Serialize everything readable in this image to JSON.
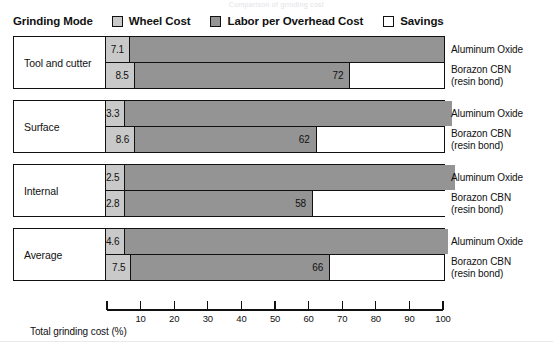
{
  "top_caption": "Comparison of grinding cost",
  "legend": {
    "axis_title": "Grinding Mode",
    "items": [
      {
        "label": "Wheel Cost",
        "icon": "wheel-cost-swatch",
        "color": "#c9c9c9"
      },
      {
        "label": "Labor per Overhead Cost",
        "icon": "labor-overhead-cost-swatch",
        "color": "#949494"
      },
      {
        "label": "Savings",
        "icon": "savings-swatch",
        "color": "#ffffff"
      }
    ]
  },
  "material_labels": {
    "aluminum_oxide": "Aluminum Oxide",
    "borazon_line1": "Borazon CBN",
    "borazon_line2": "(resin bond)"
  },
  "axis": {
    "caption": "Total grinding cost (%)",
    "ticks": [
      0,
      10,
      20,
      30,
      40,
      50,
      60,
      70,
      80,
      90,
      100
    ],
    "tick_labels": [
      "",
      "10",
      "20",
      "30",
      "40",
      "50",
      "60",
      "70",
      "80",
      "90",
      "100"
    ]
  },
  "groups": [
    {
      "mode": "Tool and cutter",
      "rows": [
        {
          "material": "Aluminum Oxide",
          "wheel": 7.1,
          "wheel_label": "7.1",
          "labor": 92.9,
          "labor_label": "",
          "savings": 0,
          "savings_label": ""
        },
        {
          "material": "Borazon CBN (resin bond)",
          "wheel": 8.5,
          "wheel_label": "8.5",
          "labor": 63.5,
          "labor_label": "72",
          "savings": 28,
          "savings_label": ""
        }
      ]
    },
    {
      "mode": "Surface",
      "rows": [
        {
          "material": "Aluminum Oxide",
          "wheel": 3.3,
          "wheel_label": "3.3",
          "labor": 96.7,
          "labor_label": "",
          "savings": 0,
          "savings_label": ""
        },
        {
          "material": "Borazon CBN (resin bond)",
          "wheel": 8.6,
          "wheel_label": "8.6",
          "labor": 53.4,
          "labor_label": "62",
          "savings": 38,
          "savings_label": ""
        }
      ]
    },
    {
      "mode": "Internal",
      "rows": [
        {
          "material": "Aluminum Oxide",
          "wheel": 2.5,
          "wheel_label": "2.5",
          "labor": 97.5,
          "labor_label": "",
          "savings": 0,
          "savings_label": ""
        },
        {
          "material": "Borazon CBN (resin bond)",
          "wheel": 2.8,
          "wheel_label": "2.8",
          "labor": 55.2,
          "labor_label": "58",
          "savings": 42,
          "savings_label": ""
        }
      ]
    },
    {
      "mode": "Average",
      "rows": [
        {
          "material": "Aluminum Oxide",
          "wheel": 4.6,
          "wheel_label": "4.6",
          "labor": 95.4,
          "labor_label": "",
          "savings": 0,
          "savings_label": ""
        },
        {
          "material": "Borazon CBN (resin bond)",
          "wheel": 7.5,
          "wheel_label": "7.5",
          "labor": 58.5,
          "labor_label": "66",
          "savings": 34,
          "savings_label": ""
        }
      ]
    }
  ],
  "chart_data": {
    "type": "bar",
    "orientation": "horizontal",
    "stacked": true,
    "title": "Comparison of grinding cost",
    "xlabel": "Total grinding cost (%)",
    "ylabel": "Grinding Mode",
    "xlim": [
      0,
      100
    ],
    "xticks": [
      0,
      10,
      20,
      30,
      40,
      50,
      60,
      70,
      80,
      90,
      100
    ],
    "grid": false,
    "legend_position": "top",
    "legend_entries": [
      "Wheel Cost",
      "Labor per Overhead Cost",
      "Savings"
    ],
    "colors": {
      "wheel_cost": "#c9c9c9",
      "labor_overhead_cost": "#949494",
      "savings": "#ffffff"
    },
    "categories": [
      "Tool and cutter",
      "Surface",
      "Internal",
      "Average"
    ],
    "materials": [
      "Aluminum Oxide",
      "Borazon CBN (resin bond)"
    ],
    "series": [
      {
        "name": "Wheel Cost",
        "values_aluminum_oxide": [
          7.1,
          3.3,
          2.5,
          4.6
        ],
        "values_borazon_cbn": [
          8.5,
          8.6,
          2.8,
          7.5
        ]
      },
      {
        "name": "Labor per Overhead Cost",
        "values_aluminum_oxide": [
          92.9,
          96.7,
          97.5,
          95.4
        ],
        "values_borazon_cbn": [
          63.5,
          53.4,
          55.2,
          58.5
        ]
      },
      {
        "name": "Savings",
        "values_aluminum_oxide": [
          0,
          0,
          0,
          0
        ],
        "values_borazon_cbn": [
          28,
          38,
          42,
          34
        ]
      }
    ],
    "cumulative_labels_borazon_cbn": [
      72,
      62,
      58,
      66
    ],
    "data_labels": {
      "Tool and cutter": {
        "Aluminum Oxide": [
          "7.1"
        ],
        "Borazon CBN (resin bond)": [
          "8.5",
          "72"
        ]
      },
      "Surface": {
        "Aluminum Oxide": [
          "3.3"
        ],
        "Borazon CBN (resin bond)": [
          "8.6",
          "62"
        ]
      },
      "Internal": {
        "Aluminum Oxide": [
          "2.5"
        ],
        "Borazon CBN (resin bond)": [
          "2.8",
          "58"
        ]
      },
      "Average": {
        "Aluminum Oxide": [
          "4.6"
        ],
        "Borazon CBN (resin bond)": [
          "7.5",
          "66"
        ]
      }
    }
  }
}
